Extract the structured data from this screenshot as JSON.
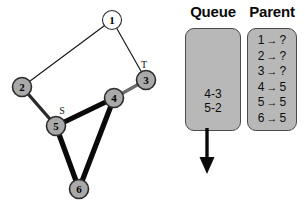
{
  "figure": {
    "graph": {
      "nodes": [
        {
          "id": "1",
          "label": "1",
          "x": 112,
          "y": 20,
          "r": 9.5,
          "fill": "#ffffff",
          "tag": ""
        },
        {
          "id": "2",
          "label": "2",
          "x": 22,
          "y": 87,
          "r": 9.5,
          "fill": "#a9a9a9",
          "tag": ""
        },
        {
          "id": "3",
          "label": "3",
          "x": 146,
          "y": 80,
          "r": 9.5,
          "fill": "#a9a9a9",
          "tag": "T"
        },
        {
          "id": "4",
          "label": "4",
          "x": 114,
          "y": 98,
          "r": 9.5,
          "fill": "#a9a9a9",
          "tag": ""
        },
        {
          "id": "5",
          "label": "5",
          "x": 56,
          "y": 126,
          "r": 9.5,
          "fill": "#a9a9a9",
          "tag": "S"
        },
        {
          "id": "6",
          "label": "6",
          "x": 79,
          "y": 189,
          "r": 9.5,
          "fill": "#a9a9a9",
          "tag": ""
        }
      ],
      "edges": [
        {
          "from": "1",
          "to": "2",
          "style": "thin",
          "width": 1.2,
          "color": "#1a1a1a"
        },
        {
          "from": "1",
          "to": "3",
          "style": "thin",
          "width": 1.2,
          "color": "#1a1a1a"
        },
        {
          "from": "2",
          "to": "5",
          "style": "medium",
          "width": 3.4,
          "color": "#2b2b2b"
        },
        {
          "from": "3",
          "to": "4",
          "style": "medium",
          "width": 3.4,
          "color": "#6d6d6d"
        },
        {
          "from": "4",
          "to": "5",
          "style": "thick",
          "width": 5.2,
          "color": "#0a0a0a"
        },
        {
          "from": "4",
          "to": "6",
          "style": "thick",
          "width": 5.2,
          "color": "#0a0a0a"
        },
        {
          "from": "5",
          "to": "6",
          "style": "thick",
          "width": 5.2,
          "color": "#0a0a0a"
        }
      ],
      "tags": {
        "source": "S",
        "target": "T"
      }
    },
    "queue": {
      "title": "Queue",
      "items": [
        "4-3",
        "5-2"
      ],
      "arrow_direction": "down"
    },
    "parent": {
      "title": "Parent",
      "arrow_glyph": "→",
      "rows": [
        {
          "node": "1",
          "value": "?"
        },
        {
          "node": "2",
          "value": "?"
        },
        {
          "node": "3",
          "value": "?"
        },
        {
          "node": "4",
          "value": "5"
        },
        {
          "node": "5",
          "value": "5"
        },
        {
          "node": "6",
          "value": "5"
        }
      ]
    },
    "colors": {
      "panel_fill": "#b8b8b8",
      "panel_border": "#4a4a4a",
      "node_fill_gray": "#a9a9a9",
      "node_fill_white": "#ffffff",
      "node_stroke": "#2b2b2b",
      "edge_dark": "#0a0a0a",
      "edge_gray": "#6d6d6d",
      "background": "#ffffff"
    }
  }
}
